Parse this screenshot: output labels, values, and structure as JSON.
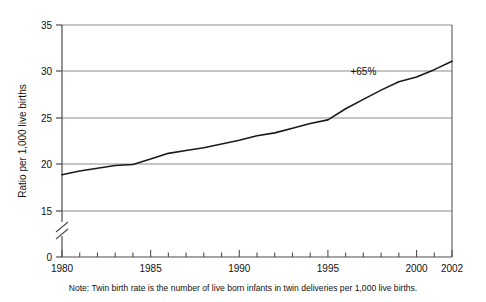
{
  "chart_data": {
    "type": "line",
    "title": "",
    "xlabel": "",
    "ylabel": "Ratio per 1,000 live births",
    "xlim": [
      1980,
      2002
    ],
    "ylim": [
      0,
      35
    ],
    "y_axis_break": true,
    "y_break_between": [
      0,
      15
    ],
    "grid": "horizontal",
    "legend": null,
    "y_ticks": [
      35,
      30,
      25,
      20,
      15,
      0
    ],
    "y_tick_labels": [
      "35",
      "30",
      "25",
      "20",
      "15",
      "0"
    ],
    "x_ticks": [
      1980,
      1981,
      1982,
      1983,
      1984,
      1985,
      1986,
      1987,
      1988,
      1989,
      1990,
      1991,
      1992,
      1993,
      1994,
      1995,
      1996,
      1997,
      1998,
      1999,
      2000,
      2001,
      2002
    ],
    "x_tick_labels_shown": [
      "1980",
      "1985",
      "1990",
      "1995",
      "2000",
      "2002"
    ],
    "x_labeled_ticks": [
      1980,
      1985,
      1990,
      1995,
      2000,
      2002
    ],
    "series": [
      {
        "name": "Twin birth rate",
        "color": "#1a1a1a",
        "x": [
          1980,
          1981,
          1982,
          1983,
          1984,
          1985,
          1986,
          1987,
          1988,
          1989,
          1990,
          1991,
          1992,
          1993,
          1994,
          1995,
          1996,
          1997,
          1998,
          1999,
          2000,
          2001,
          2002
        ],
        "values": [
          18.9,
          19.3,
          19.6,
          19.9,
          20.0,
          20.6,
          21.2,
          21.5,
          21.8,
          22.2,
          22.6,
          23.1,
          23.4,
          23.9,
          24.4,
          24.8,
          26.0,
          27.0,
          28.0,
          28.9,
          29.4,
          30.2,
          31.1
        ]
      }
    ],
    "annotations": [
      {
        "text": "+65%",
        "x": 1997.0,
        "y": 29.6
      }
    ],
    "note": "Note: Twin birth rate is the number of live born infants in twin deliveries per 1,000 live births.",
    "colors": {
      "line": "#1a1a1a",
      "grid": "#8c8c8c",
      "axis": "#4d4d4d",
      "text": "#111111",
      "background": "#ffffff"
    }
  }
}
